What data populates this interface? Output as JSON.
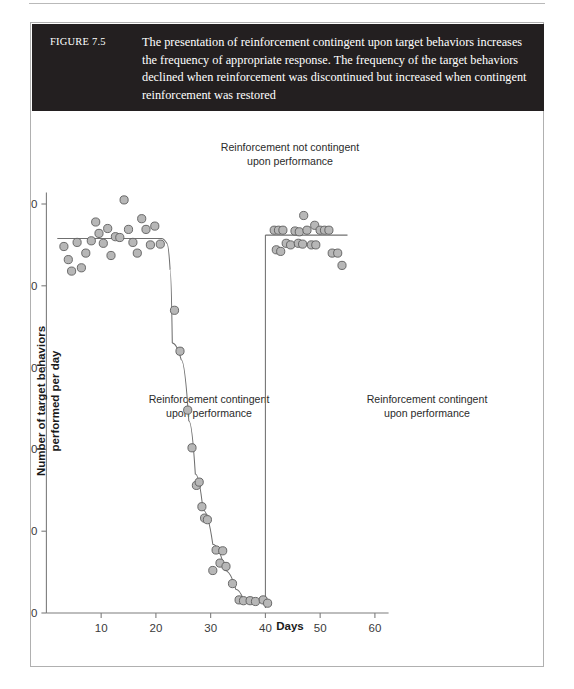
{
  "figure": {
    "number_label": "FIGURE 7.5",
    "caption": "The presentation of reinforcement contingent upon target behaviors increases the frequency of appropriate response. The frequency of the target behaviors declined when reinforcement was discontinued but increased when contingent reinforcement was restored"
  },
  "annotations": {
    "top_line1": "Reinforcement not contingent",
    "top_line2": "upon performance",
    "left_line1": "Reinforcement contingent",
    "left_line2": "upon performance",
    "right_line1": "Reinforcement contingent",
    "right_line2": "upon performance"
  },
  "chart_data": {
    "type": "scatter",
    "title": "",
    "xlabel": "Days",
    "ylabel": "Number of target behaviors performed per day",
    "xlim": [
      0,
      62
    ],
    "ylim": [
      0,
      52
    ],
    "xticks": [
      10,
      20,
      30,
      40,
      50,
      60
    ],
    "yticks": [
      0,
      10,
      20,
      30,
      40,
      50
    ],
    "grid": false,
    "legend": null,
    "marker_color": "#b7b7b7",
    "marker_edge_color": "#5c5c5c",
    "line_color": "#6f6f6f",
    "phase_dividers_x": [
      40
    ],
    "series": [
      {
        "name": "Baseline phase - contingent reinforcement",
        "points": [
          {
            "x": 3.2,
            "y": 44.8
          },
          {
            "x": 4.0,
            "y": 43.2
          },
          {
            "x": 4.6,
            "y": 41.8
          },
          {
            "x": 5.6,
            "y": 45.3
          },
          {
            "x": 6.4,
            "y": 42.2
          },
          {
            "x": 7.2,
            "y": 44.0
          },
          {
            "x": 8.2,
            "y": 45.5
          },
          {
            "x": 9.0,
            "y": 47.8
          },
          {
            "x": 9.6,
            "y": 46.4
          },
          {
            "x": 10.4,
            "y": 45.2
          },
          {
            "x": 11.2,
            "y": 47.0
          },
          {
            "x": 11.8,
            "y": 43.7
          },
          {
            "x": 12.6,
            "y": 46.0
          },
          {
            "x": 13.4,
            "y": 45.9
          },
          {
            "x": 14.2,
            "y": 50.5
          },
          {
            "x": 15.0,
            "y": 46.9
          },
          {
            "x": 15.8,
            "y": 45.3
          },
          {
            "x": 16.6,
            "y": 44.0
          },
          {
            "x": 17.4,
            "y": 48.2
          },
          {
            "x": 18.2,
            "y": 46.9
          },
          {
            "x": 19.0,
            "y": 45.0
          },
          {
            "x": 19.8,
            "y": 47.3
          },
          {
            "x": 20.8,
            "y": 45.1
          }
        ]
      },
      {
        "name": "Extinction phase - reinforcement not contingent",
        "points": [
          {
            "x": 23.4,
            "y": 37.0
          },
          {
            "x": 24.4,
            "y": 32.0
          },
          {
            "x": 25.8,
            "y": 24.8
          },
          {
            "x": 26.6,
            "y": 20.2
          },
          {
            "x": 27.4,
            "y": 15.6
          },
          {
            "x": 27.9,
            "y": 16.0
          },
          {
            "x": 28.4,
            "y": 13.0
          },
          {
            "x": 28.9,
            "y": 11.6
          },
          {
            "x": 29.4,
            "y": 11.4
          },
          {
            "x": 30.4,
            "y": 5.2
          },
          {
            "x": 31.0,
            "y": 7.7
          },
          {
            "x": 31.7,
            "y": 6.1
          },
          {
            "x": 32.2,
            "y": 7.6
          },
          {
            "x": 32.8,
            "y": 5.7
          },
          {
            "x": 34.0,
            "y": 3.6
          },
          {
            "x": 35.2,
            "y": 1.6
          },
          {
            "x": 36.0,
            "y": 1.5
          },
          {
            "x": 37.2,
            "y": 1.5
          },
          {
            "x": 38.2,
            "y": 1.4
          },
          {
            "x": 39.6,
            "y": 1.6
          },
          {
            "x": 40.4,
            "y": 1.2
          }
        ]
      },
      {
        "name": "Reinstatement phase - contingent reinforcement restored",
        "points": [
          {
            "x": 41.6,
            "y": 46.8
          },
          {
            "x": 42.4,
            "y": 46.8
          },
          {
            "x": 43.2,
            "y": 46.8
          },
          {
            "x": 42.0,
            "y": 44.4
          },
          {
            "x": 42.8,
            "y": 44.2
          },
          {
            "x": 43.8,
            "y": 45.2
          },
          {
            "x": 44.6,
            "y": 45.0
          },
          {
            "x": 45.4,
            "y": 46.7
          },
          {
            "x": 46.2,
            "y": 46.6
          },
          {
            "x": 46.0,
            "y": 45.2
          },
          {
            "x": 46.8,
            "y": 45.1
          },
          {
            "x": 47.0,
            "y": 48.6
          },
          {
            "x": 47.6,
            "y": 46.8
          },
          {
            "x": 48.4,
            "y": 45.0
          },
          {
            "x": 49.2,
            "y": 45.0
          },
          {
            "x": 49.0,
            "y": 47.4
          },
          {
            "x": 50.0,
            "y": 46.8
          },
          {
            "x": 50.8,
            "y": 46.8
          },
          {
            "x": 51.6,
            "y": 46.8
          },
          {
            "x": 52.2,
            "y": 44.0
          },
          {
            "x": 53.2,
            "y": 44.0
          },
          {
            "x": 54.0,
            "y": 42.5
          }
        ]
      }
    ],
    "trend_segments": [
      {
        "name": "baseline-plateau",
        "points": [
          [
            2.0,
            45.8
          ],
          [
            21.0,
            45.8
          ],
          [
            22.0,
            45.2
          ],
          [
            22.6,
            42.0
          ],
          [
            23.0,
            33.0
          ]
        ]
      },
      {
        "name": "decline",
        "points": [
          [
            23.0,
            33.0
          ],
          [
            24.6,
            31.0
          ],
          [
            26.0,
            23.5
          ],
          [
            27.2,
            17.0
          ],
          [
            28.6,
            12.6
          ],
          [
            30.4,
            8.4
          ],
          [
            32.6,
            5.2
          ],
          [
            34.6,
            2.9
          ],
          [
            36.0,
            1.6
          ],
          [
            40.0,
            1.5
          ]
        ]
      },
      {
        "name": "reinstatement-plateau",
        "points": [
          [
            40.0,
            46.2
          ],
          [
            55.0,
            46.2
          ]
        ]
      }
    ]
  }
}
